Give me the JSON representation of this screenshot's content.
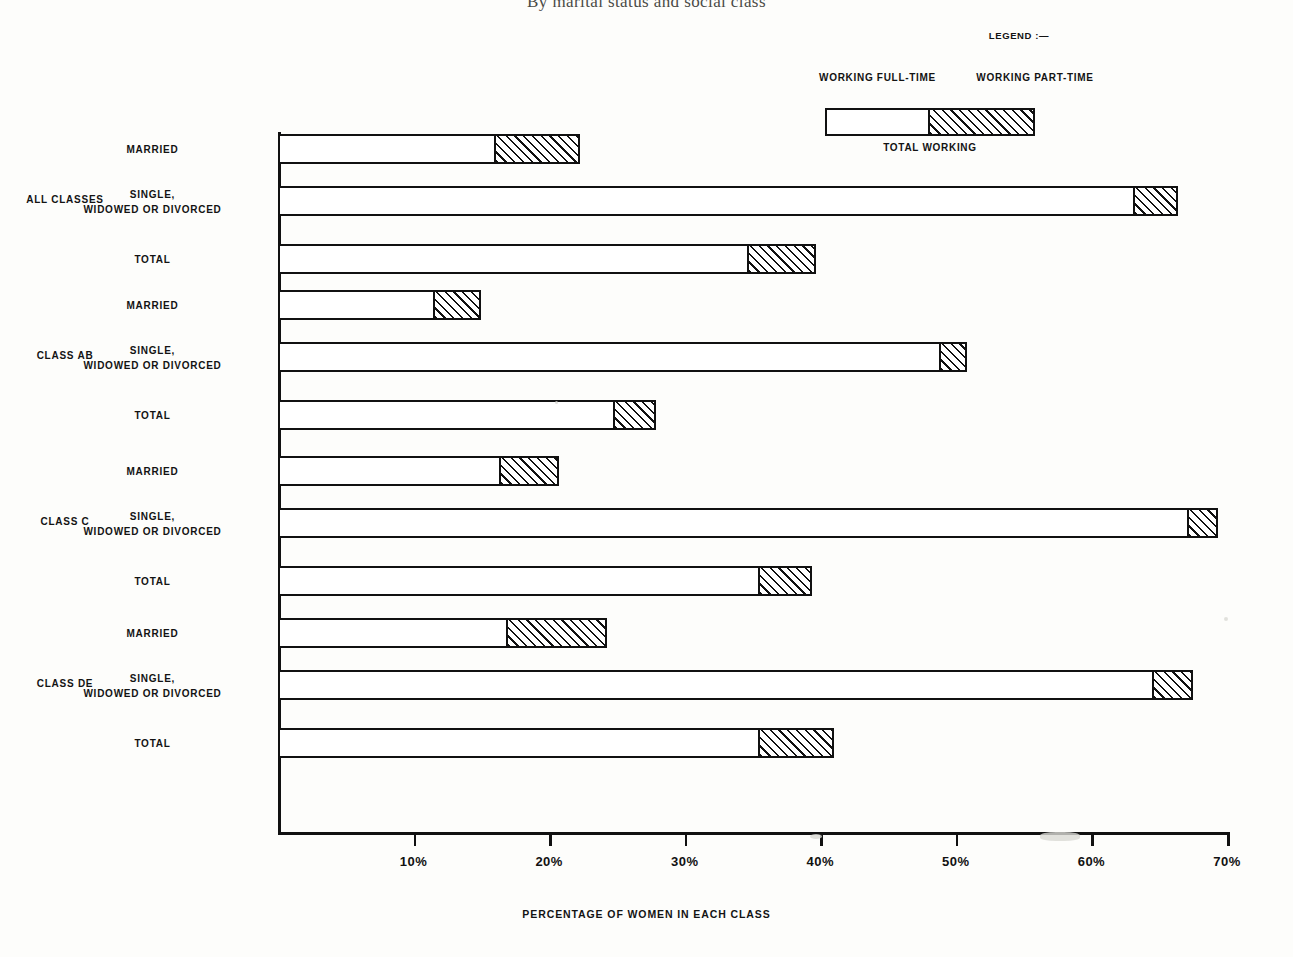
{
  "title": "By marital status and social class",
  "legend": {
    "heading": "LEGEND :—",
    "full_time_label": "WORKING FULL-TIME",
    "part_time_label": "WORKING PART-TIME",
    "total_label": "TOTAL WORKING"
  },
  "axis": {
    "x_title": "PERCENTAGE OF WOMEN IN EACH CLASS",
    "ticks": [
      "10%",
      "20%",
      "30%",
      "40%",
      "50%",
      "60%",
      "70%"
    ]
  },
  "chart_data": {
    "type": "bar",
    "orientation": "horizontal",
    "stacked": true,
    "title": "By marital status and social class",
    "xlabel": "PERCENTAGE OF WOMEN IN EACH CLASS",
    "ylabel": "",
    "xlim": [
      0,
      70
    ],
    "xtick_values": [
      10,
      20,
      30,
      40,
      50,
      60,
      70
    ],
    "xtick_labels": [
      "10%",
      "20%",
      "30%",
      "40%",
      "50%",
      "60%",
      "70%"
    ],
    "grid": false,
    "legend_position": "top-right",
    "series": [
      {
        "name": "WORKING FULL-TIME",
        "fill": "white"
      },
      {
        "name": "WORKING PART-TIME",
        "fill": "diagonal-hatch"
      }
    ],
    "groups": [
      {
        "group_label": "ALL CLASSES",
        "rows": [
          {
            "label_lines": [
              "MARRIED"
            ],
            "full_time": 16.0,
            "part_time": 6.3,
            "total": 22.3
          },
          {
            "label_lines": [
              "SINGLE,",
              "WIDOWED OR DIVORCED"
            ],
            "full_time": 63.2,
            "part_time": 3.2,
            "total": 66.4
          },
          {
            "label_lines": [
              "TOTAL"
            ],
            "full_time": 34.7,
            "part_time": 5.0,
            "total": 39.7
          }
        ]
      },
      {
        "group_label": "CLASS AB",
        "rows": [
          {
            "label_lines": [
              "MARRIED"
            ],
            "full_time": 11.5,
            "part_time": 3.5,
            "total": 15.0
          },
          {
            "label_lines": [
              "SINGLE,",
              "WIDOWED OR DIVORCED"
            ],
            "full_time": 48.9,
            "part_time": 1.9,
            "total": 50.8
          },
          {
            "label_lines": [
              "TOTAL"
            ],
            "full_time": 24.8,
            "part_time": 3.1,
            "total": 27.9
          }
        ]
      },
      {
        "group_label": "CLASS C",
        "rows": [
          {
            "label_lines": [
              "MARRIED"
            ],
            "full_time": 16.4,
            "part_time": 4.3,
            "total": 20.7
          },
          {
            "label_lines": [
              "SINGLE,",
              "WIDOWED OR DIVORCED"
            ],
            "full_time": 67.2,
            "part_time": 2.1,
            "total": 69.3
          },
          {
            "label_lines": [
              "TOTAL"
            ],
            "full_time": 35.5,
            "part_time": 3.9,
            "total": 39.4
          }
        ]
      },
      {
        "group_label": "CLASS DE",
        "rows": [
          {
            "label_lines": [
              "MARRIED"
            ],
            "full_time": 16.9,
            "part_time": 7.4,
            "total": 24.3
          },
          {
            "label_lines": [
              "SINGLE,",
              "WIDOWED OR DIVORCED"
            ],
            "full_time": 64.6,
            "part_time": 2.9,
            "total": 67.5
          },
          {
            "label_lines": [
              "TOTAL"
            ],
            "full_time": 35.5,
            "part_time": 5.5,
            "total": 41.0
          }
        ]
      }
    ]
  }
}
